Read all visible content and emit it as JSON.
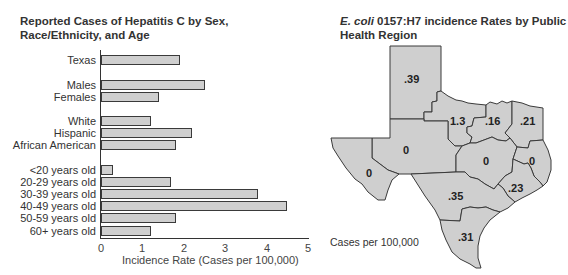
{
  "chart_data": [
    {
      "type": "bar",
      "orientation": "horizontal",
      "title": "Reported Cases of Hepatitis C by Sex, Race/Ethnicity, and Age",
      "xlabel": "Incidence Rate (Cases per 100,000)",
      "ylabel": "",
      "xlim": [
        0,
        5
      ],
      "xticks": [
        "0",
        "1",
        "2",
        "3",
        "4",
        "5"
      ],
      "grid": false,
      "categories": [
        "Texas",
        "Males",
        "Females",
        "White",
        "Hispanic",
        "African American",
        "<20 years old",
        "20-29 years old",
        "30-39 years old",
        "40-49 years old",
        "50-59 years old",
        "60+ years old"
      ],
      "values": [
        1.9,
        2.5,
        1.4,
        1.2,
        2.2,
        1.8,
        0.3,
        1.7,
        3.8,
        4.5,
        1.8,
        1.2
      ]
    },
    {
      "type": "choropleth-map",
      "title": "E. coli 0157:H7 incidence Rates by Public Health Region",
      "legend": "Cases per 100,000",
      "regions": [
        {
          "name": "Panhandle",
          "value": ".39"
        },
        {
          "name": "North Central West",
          "value": "1.3"
        },
        {
          "name": "North Central",
          "value": ".16"
        },
        {
          "name": "Northeast",
          "value": ".21"
        },
        {
          "name": "West",
          "value": "0"
        },
        {
          "name": "Far West",
          "value": "0"
        },
        {
          "name": "Central",
          "value": "0"
        },
        {
          "name": "East",
          "value": "0"
        },
        {
          "name": "Southeast",
          "value": ".23"
        },
        {
          "name": "South Central",
          "value": ".35"
        },
        {
          "name": "South",
          "value": ".31"
        }
      ]
    }
  ],
  "hep": {
    "title": "Reported Cases of Hepatitis C by Sex, Race/Ethnicity, and Age",
    "xlabel": "Incidence Rate (Cases per 100,000)",
    "ticks": [
      "0",
      "1",
      "2",
      "3",
      "4",
      "5"
    ],
    "bars": [
      {
        "label": "Texas",
        "value": 1.9
      },
      {
        "label": "Males",
        "value": 2.5
      },
      {
        "label": "Females",
        "value": 1.4
      },
      {
        "label": "White",
        "value": 1.2
      },
      {
        "label": "Hispanic",
        "value": 2.2
      },
      {
        "label": "African American",
        "value": 1.8
      },
      {
        "label": "<20 years old",
        "value": 0.3
      },
      {
        "label": "20-29 years old",
        "value": 1.7
      },
      {
        "label": "30-39 years old",
        "value": 3.8
      },
      {
        "label": "40-49 years old",
        "value": 4.5
      },
      {
        "label": "50-59 years old",
        "value": 1.8
      },
      {
        "label": "60+ years old",
        "value": 1.2
      }
    ]
  },
  "ecoli": {
    "title_italic": "E. coli",
    "title_rest": " 0157:H7 incidence Rates by Public Health Region",
    "legend": "Cases per 100,000",
    "labels": [
      ".39",
      "1.3",
      ".16",
      ".21",
      "0",
      "0",
      "0",
      "0",
      ".23",
      ".35",
      ".31"
    ]
  },
  "colors": {
    "bar_fill": "#cfcfcf",
    "outline": "#3a3a3a",
    "map_fill": "#cfcfcf"
  }
}
